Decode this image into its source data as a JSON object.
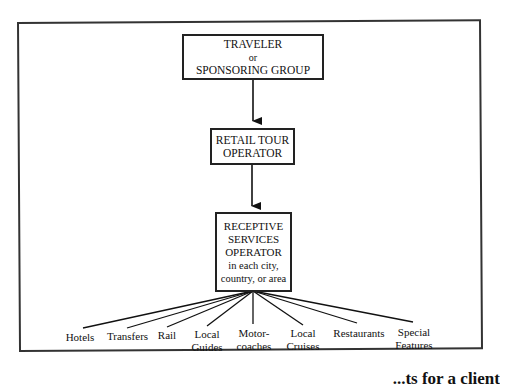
{
  "diagram": {
    "type": "flowchart",
    "nodes": {
      "traveler": {
        "line1": "TRAVELER",
        "line2": "or",
        "line3": "SPONSORING GROUP"
      },
      "retail": {
        "line1": "RETAIL TOUR",
        "line2": "OPERATOR"
      },
      "receptive": {
        "line1": "RECEPTIVE",
        "line2": "SERVICES",
        "line3": "OPERATOR",
        "line4": "in each city,",
        "line5": "country, or area"
      }
    },
    "leaves": [
      {
        "line1": "Hotels",
        "line2": ""
      },
      {
        "line1": "Transfers",
        "line2": ""
      },
      {
        "line1": "Rail",
        "line2": ""
      },
      {
        "line1": "Local",
        "line2": "Guides"
      },
      {
        "line1": "Motor-",
        "line2": "coaches"
      },
      {
        "line1": "Local",
        "line2": "Cruises"
      },
      {
        "line1": "Restaurants",
        "line2": ""
      },
      {
        "line1": "Special",
        "line2": "Features"
      }
    ],
    "edges": [
      "traveler -> retail",
      "retail -> receptive",
      "receptive -- Hotels",
      "receptive -- Transfers",
      "receptive -- Rail",
      "receptive -- Local Guides",
      "receptive -- Motor-coaches",
      "receptive -- Local Cruises",
      "receptive -- Restaurants",
      "receptive -- Special Features"
    ],
    "caption_partial": "...ts for a client"
  }
}
